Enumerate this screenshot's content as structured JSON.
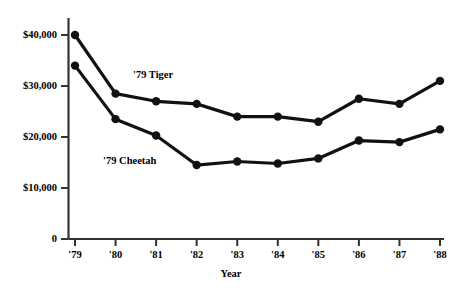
{
  "chart_data": {
    "type": "line",
    "title": "",
    "xlabel": "Year",
    "ylabel": "",
    "categories": [
      "'79",
      "'80",
      "'81",
      "'82",
      "'83",
      "'84",
      "'85",
      "'86",
      "'87",
      "'88"
    ],
    "ytick_labels": [
      "0",
      "$10,000",
      "$20,000",
      "$30,000",
      "$40,000"
    ],
    "ytick_values": [
      0,
      10000,
      20000,
      30000,
      40000
    ],
    "ylim": [
      0,
      44000
    ],
    "grid": false,
    "legend_position": "inline-annotations",
    "series": [
      {
        "name": "'79 Tiger",
        "values": [
          40000,
          28500,
          27000,
          26500,
          24000,
          24000,
          23000,
          27500,
          26500,
          31000
        ]
      },
      {
        "name": "'79 Cheetah",
        "values": [
          34000,
          23500,
          20300,
          14500,
          15200,
          14800,
          15800,
          19300,
          19000,
          21500
        ]
      }
    ],
    "annotations": [
      {
        "text": "'79 Tiger",
        "x_px": 133,
        "y_px": 69
      },
      {
        "text": "'79 Cheetah",
        "x_px": 103,
        "y_px": 155
      }
    ],
    "colors": {
      "line": "#111111",
      "marker": "#111111",
      "axis": "#333333",
      "background": "#ffffff"
    }
  },
  "axis": {
    "x_title": "Year"
  }
}
